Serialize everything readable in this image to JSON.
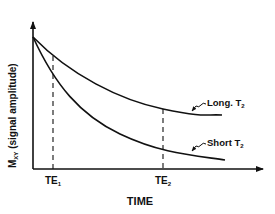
{
  "diagram": {
    "type": "T2 decay curves",
    "y_axis_label": {
      "main": "M",
      "subscript": "XY",
      "rest": " (signal amplitude)"
    },
    "x_axis_label": "TIME",
    "curves": [
      {
        "id": "long-t2",
        "label_main": "Long. T",
        "label_sub": "2"
      },
      {
        "id": "short-t2",
        "label_main": "Short T",
        "label_sub": "2"
      }
    ],
    "markers": [
      {
        "id": "te1",
        "label_main": "TE",
        "label_sub": "1"
      },
      {
        "id": "te2",
        "label_main": "TE",
        "label_sub": "2"
      }
    ],
    "colors": {
      "line": "#111111",
      "background": "#ffffff"
    }
  }
}
